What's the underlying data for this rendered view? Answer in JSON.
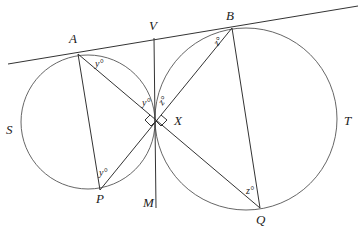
{
  "diagram": {
    "points": {
      "A": {
        "label": "A",
        "x": 78,
        "y": 55
      },
      "B": {
        "label": "B",
        "x": 232,
        "y": 28
      },
      "V": {
        "label": "V",
        "x": 154,
        "y": 30
      },
      "X": {
        "label": "X",
        "x": 156,
        "y": 120
      },
      "P": {
        "label": "P",
        "x": 100,
        "y": 190
      },
      "Q": {
        "label": "Q",
        "x": 260,
        "y": 208
      },
      "M": {
        "label": "M",
        "x": 150,
        "y": 208
      }
    },
    "circles": {
      "S": {
        "label": "S",
        "cx": 88,
        "cy": 122,
        "r": 67
      },
      "T": {
        "label": "T",
        "cx": 246,
        "cy": 119,
        "r": 91
      }
    },
    "angles": {
      "y_at_A": "y°",
      "y_at_X": "y°",
      "y_at_P": "y°",
      "z_at_B": "z°",
      "z_at_X": "z°",
      "z_at_Q": "z°"
    },
    "right_angle_marks": 2,
    "colors": {
      "line": "#333333",
      "circle": "#555555",
      "text": "#222222"
    }
  }
}
